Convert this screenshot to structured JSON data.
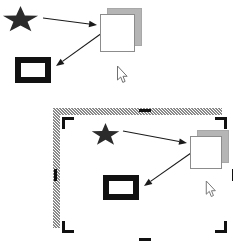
{
  "canvas": {
    "width": 233,
    "height": 242,
    "background": "#ffffff"
  },
  "palette": {
    "star_fill": "#2b2b2b",
    "window_face": "#ffffff",
    "window_border": "#8c8c8c",
    "window_shadow": "#b5b5b5",
    "frame_border": "#111111",
    "arrow_color": "#1a1a1a",
    "hatch_color": "#8a8a8a",
    "handle_color": "#111111"
  },
  "scenes": [
    {
      "id": "unselected-scene",
      "label": "Unselected scene",
      "selected": false,
      "bounds": {
        "x": 0,
        "y": 0,
        "width": 233,
        "height": 92
      },
      "shapes": [
        {
          "id": "star",
          "kind": "star",
          "label": "Star shape",
          "x": 2,
          "y": 6,
          "width": 37,
          "height": 28,
          "fill": "#2b2b2b"
        },
        {
          "id": "window",
          "kind": "window",
          "label": "Window with drop shadow",
          "x": 100,
          "y": 8,
          "width": 33,
          "height": 36,
          "shadow_offset_x": 7,
          "shadow_offset_y": -6,
          "face": "#ffffff",
          "border": "#8c8c8c",
          "shadow": "#b5b5b5"
        },
        {
          "id": "picture-frame",
          "kind": "frame",
          "label": "Thick black picture frame",
          "x": 15,
          "y": 57,
          "width": 36,
          "height": 26,
          "border_width": 6,
          "border": "#111111",
          "fill": "#ffffff"
        }
      ],
      "arrows": [
        {
          "id": "arrow-star-to-window",
          "label": "Arrow from star to window",
          "from": "star",
          "to": "window",
          "x1": 43,
          "y1": 18,
          "x2": 97,
          "y2": 25
        },
        {
          "id": "arrow-window-to-frame",
          "label": "Arrow from window to picture frame",
          "from": "window",
          "to": "picture-frame",
          "x1": 102,
          "y1": 33,
          "x2": 56,
          "y2": 66
        }
      ],
      "cursor": {
        "id": "pointer",
        "label": "Mouse pointer",
        "x": 116,
        "y": 66,
        "width": 13,
        "height": 18
      }
    },
    {
      "id": "selected-scene",
      "label": "Selected scene with selection border",
      "selected": true,
      "bounds": {
        "x": 46,
        "y": 101,
        "width": 183,
        "height": 134
      },
      "selection": {
        "label": "Selection frame",
        "border_width": 7,
        "hatch_color": "#8a8a8a",
        "corner_handles": [
          {
            "id": "handle-top-left",
            "label": "Top-left corner bracket",
            "position": "top-left"
          },
          {
            "id": "handle-top-right",
            "label": "Top-right corner bracket",
            "position": "top-right"
          },
          {
            "id": "handle-bottom-left",
            "label": "Bottom-left corner bracket",
            "position": "bottom-left"
          },
          {
            "id": "handle-bottom-right",
            "label": "Bottom-right corner bracket",
            "position": "bottom-right"
          }
        ],
        "edge_handles": [
          {
            "id": "handle-top-center",
            "label": "Top edge handle",
            "position": "top-center"
          },
          {
            "id": "handle-left-middle",
            "label": "Left edge handle",
            "position": "left-middle"
          },
          {
            "id": "handle-right-middle",
            "label": "Right edge handle",
            "position": "right-middle"
          },
          {
            "id": "handle-bottom-center",
            "label": "Bottom edge handle",
            "position": "bottom-center"
          }
        ]
      },
      "shapes": [
        {
          "id": "star",
          "kind": "star",
          "label": "Star shape",
          "x": 84,
          "y": 116,
          "width": 29,
          "height": 24,
          "fill": "#2b2b2b"
        },
        {
          "id": "window",
          "kind": "window",
          "label": "Window with drop shadow",
          "x": 183,
          "y": 123,
          "width": 30,
          "height": 31,
          "shadow_offset_x": 7,
          "shadow_offset_y": -6,
          "face": "#ffffff",
          "border": "#8c8c8c",
          "shadow": "#b5b5b5"
        },
        {
          "id": "picture-frame",
          "kind": "frame",
          "label": "Thick black picture frame",
          "x": 96,
          "y": 168,
          "width": 36,
          "height": 25,
          "border_width": 6,
          "border": "#111111",
          "fill": "#ffffff"
        }
      ],
      "arrows": [
        {
          "id": "arrow-star-to-window",
          "label": "Arrow from star to window",
          "from": "star",
          "to": "window",
          "x1": 116,
          "y1": 124,
          "x2": 180,
          "y2": 136
        },
        {
          "id": "arrow-window-to-frame",
          "label": "Arrow from window to picture frame",
          "from": "window",
          "to": "picture-frame",
          "x1": 184,
          "y1": 146,
          "x2": 137,
          "y2": 179
        }
      ],
      "cursor": {
        "id": "pointer",
        "label": "Mouse pointer",
        "x": 198,
        "y": 174,
        "width": 12,
        "height": 17
      }
    }
  ]
}
